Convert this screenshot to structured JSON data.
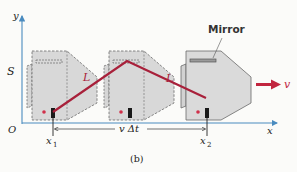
{
  "figure": {
    "caption": "(b)",
    "axes": {
      "y_label": "y",
      "x_label": "x",
      "origin_label": "O",
      "frame_label": "S",
      "axis_color": "#4a8bbf"
    },
    "labels": {
      "mirror": "Mirror",
      "path_left": "L",
      "path_right": "L",
      "velocity": "v",
      "x1_main": "x",
      "x1_sub": "1",
      "x2_main": "x",
      "x2_sub": "2",
      "displacement": "v Δt"
    },
    "colors": {
      "light_path": "#a8203a",
      "clock_fill": "#d8d8d8",
      "clock_edge": "#6a6a6a",
      "source": "#d0304a",
      "detector": "#1a1a1a",
      "velocity_arrow": "#c2253f"
    },
    "clocks": [
      {
        "position": "x1",
        "style": "dashed"
      },
      {
        "position": "mid",
        "style": "dashed"
      },
      {
        "position": "x2",
        "style": "solid"
      }
    ]
  }
}
